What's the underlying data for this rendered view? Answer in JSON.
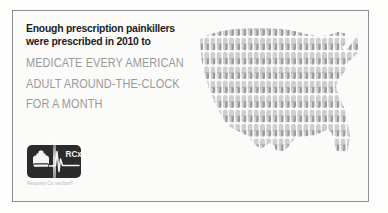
{
  "frame": {
    "border_color": "#8e8e8e",
    "background": "#fbfbfa"
  },
  "headline": {
    "line1": "Enough prescription painkillers",
    "line2": "were prescribed in 2010 to",
    "color": "#1d1d1d"
  },
  "statement": {
    "line1": "MEDICATE EVERY AMERICAN",
    "line2": "ADULT AROUND-THE-CLOCK",
    "line3": "FOR A MONTH",
    "color": "#9a9a9a"
  },
  "logo": {
    "badge_color": "#2b2b2b",
    "mark_text": "RCx",
    "phone_icon": "telephone-icon",
    "pulse_icon": "heartbeat-line-icon",
    "caption": "Recovery Connection®",
    "caption_color": "#b4b4b4"
  },
  "map": {
    "name": "united-states-map",
    "fill_motif": "capsule-pill",
    "pill_color_light": "#cfcfcf",
    "pill_color_dark": "#9b9b9b",
    "columns": 26,
    "rows": 9,
    "pill_width": 5,
    "pill_height": 13,
    "column_pitch": 6.2,
    "row_pitch": 14.4
  }
}
